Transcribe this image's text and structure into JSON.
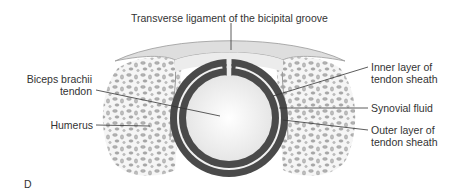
{
  "figure": {
    "panel_letter": "D",
    "labels": {
      "transverse_ligament": "Transverse ligament of the bicipital groove",
      "biceps_tendon_line1": "Biceps brachii",
      "biceps_tendon_line2": "tendon",
      "humerus": "Humerus",
      "inner_layer_line1": "Inner layer of",
      "inner_layer_line2": "tendon sheath",
      "synovial_fluid": "Synovial fluid",
      "outer_layer_line1": "Outer layer of",
      "outer_layer_line2": "tendon sheath"
    },
    "colors": {
      "sheath": "#4a4a4a",
      "tendon": "#efefef",
      "bone": "#b8b8b8",
      "ligament": "#dcdcdc",
      "leader_line": "#333333"
    }
  }
}
